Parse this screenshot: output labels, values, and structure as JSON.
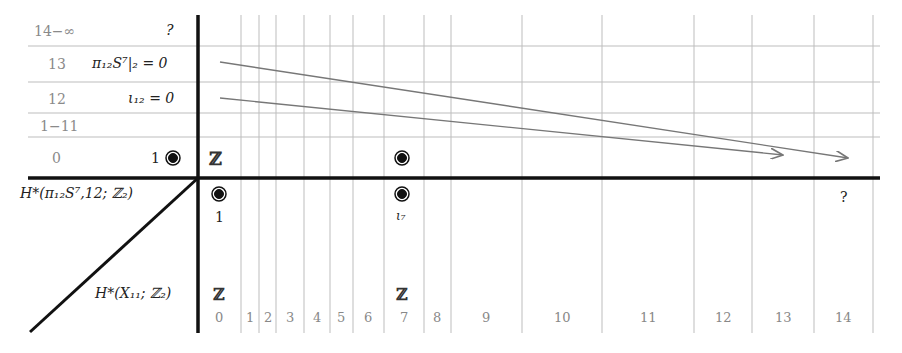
{
  "rows": [
    {
      "degree": "14−∞",
      "entry": "?",
      "y": 30
    },
    {
      "degree": "13",
      "entry": "π₁₂S⁷|₂ = 0",
      "y": 64
    },
    {
      "degree": "12",
      "entry": "ι₁₂ = 0",
      "y": 99
    },
    {
      "degree": "1−11",
      "entry": "",
      "y": 126
    },
    {
      "degree": "0",
      "entry": "1",
      "y": 158
    }
  ],
  "vertical_axis_label": "H*(π₁₂S⁷,12; ℤ₂)",
  "horizontal_axis_label": "H*(X₁₁; ℤ₂)",
  "columns": [
    "0",
    "1",
    "2",
    "3",
    "4",
    "5",
    "6",
    "7",
    "8",
    "9",
    "10",
    "11",
    "12",
    "13",
    "14"
  ],
  "column_centers": [
    219,
    250,
    268,
    290,
    317,
    341,
    368,
    404,
    437,
    486,
    562,
    648,
    723,
    783,
    843
  ],
  "column_separators": [
    241,
    259,
    276,
    304,
    330,
    353,
    384,
    424,
    451,
    522,
    602,
    694,
    752,
    814,
    873
  ],
  "row_separators": [
    46,
    82,
    113,
    137
  ],
  "e2_page": {
    "row0": [
      {
        "col": "0",
        "label": "ℤ"
      },
      {
        "col": "7",
        "dot": true
      }
    ],
    "top_row_labels": [
      {
        "col": "0",
        "text": "1",
        "dot": true
      },
      {
        "col": "7",
        "text": "ι₇",
        "dot": true
      },
      {
        "col": "14",
        "text": "?"
      }
    ],
    "bottom_row_labels": [
      {
        "col": "0",
        "text": "ℤ"
      },
      {
        "col": "7",
        "text": "ℤ"
      }
    ]
  },
  "differentials": [
    {
      "from_row": "13",
      "to_col": "14",
      "from": [
        220,
        62
      ],
      "to": [
        848,
        158
      ]
    },
    {
      "from_row": "12",
      "to_col": "13",
      "from": [
        220,
        98
      ],
      "to": [
        783,
        155
      ]
    }
  ],
  "colors": {
    "axis": "#111111",
    "grid": "#bdbdbd",
    "arrow": "#777777",
    "gray_text": "#8a8a8a"
  }
}
